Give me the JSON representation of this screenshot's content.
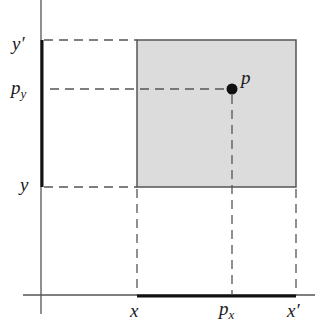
{
  "diagram": {
    "colors": {
      "axis": "#555555",
      "rect_fill": "#dcdcdc",
      "rect_stroke": "#555555",
      "dash": "#555555",
      "interval": "#111111",
      "point": "#111111"
    },
    "point": {
      "label": "p",
      "x_label_main": "p",
      "x_label_sub": "x",
      "y_label_main": "p",
      "y_label_sub": "y"
    },
    "x_axis_labels": {
      "min": "x",
      "max": "x′"
    },
    "y_axis_labels": {
      "min": "y",
      "max": "y′"
    }
  }
}
